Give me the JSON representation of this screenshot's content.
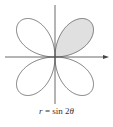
{
  "figure": {
    "equation": "r = sin 2θ",
    "equation_parts": {
      "lhs": "r",
      "eq": " = sin 2",
      "var": "θ"
    },
    "curve": "four-leaved rose",
    "shaded_petal": "first quadrant",
    "colors": {
      "curve": "#555555",
      "axes": "#444444",
      "shade": "#e0e0e0",
      "background": "#ffffff"
    }
  },
  "chart_data": {
    "type": "polar-curve",
    "function": "r = sin(2*theta)",
    "theta_range": [
      0,
      6.283
    ],
    "petals": 4,
    "shaded_region": {
      "theta_range": [
        0,
        1.5708
      ],
      "quadrant": 1
    },
    "axes": {
      "x_arrow": true,
      "y_arrow": false
    },
    "caption": "r = sin 2θ"
  }
}
